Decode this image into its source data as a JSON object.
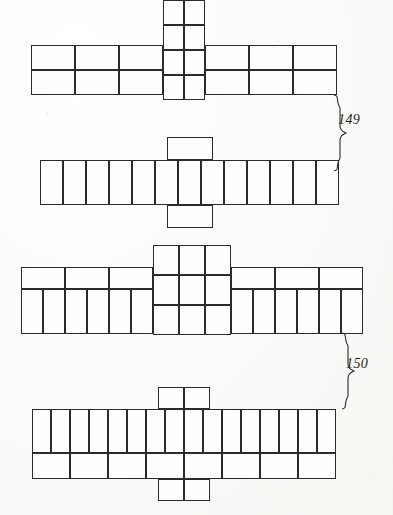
{
  "document": {
    "kind": "printed-plate",
    "background_color": "#fdfdfb",
    "ink_color": "#2b2b2b",
    "page_width": 393,
    "page_height": 515
  },
  "labels": [
    {
      "id": "label-149",
      "text": "149",
      "x": 340,
      "y": 119
    },
    {
      "id": "label-150",
      "text": "150",
      "x": 348,
      "y": 362
    }
  ],
  "braces": [
    {
      "id": "brace-149",
      "spans": "figure-1 and figure-2",
      "x": 336,
      "y": 96,
      "height": 72
    },
    {
      "id": "brace-150",
      "spans": "figure-3 and figure-4",
      "x": 344,
      "y": 334,
      "height": 72
    }
  ],
  "figures": [
    {
      "id": "figure-1",
      "name": "cross-net-top",
      "description": "Horizontal band of 3+3 wide cells in 2 rows with a central 2-wide x 4-tall column",
      "left_wing": {
        "cols": 3,
        "rows": 2
      },
      "right_wing": {
        "cols": 3,
        "rows": 2
      },
      "center": {
        "cols": 2,
        "rows": 4
      }
    },
    {
      "id": "figure-2",
      "name": "strip-net-second",
      "description": "Single row of 13 tall narrow cells with one wide tab above and one below at the centre",
      "strip_cells": 13,
      "tab_above": 1,
      "tab_below": 1
    },
    {
      "id": "figure-3",
      "name": "cross-net-third",
      "description": "Wings of 3 wide cells over 6 narrow cells, with a central 3x3 block",
      "left_wing": {
        "top_cols": 3,
        "bottom_cols": 6
      },
      "right_wing": {
        "top_cols": 3,
        "bottom_cols": 6
      },
      "center": {
        "cols": 3,
        "rows": 3
      }
    },
    {
      "id": "figure-4",
      "name": "strip-net-bottom",
      "description": "Top row of 16 narrow cells over bottom row of 8 wide cells, with a 2-cell tab above and below",
      "top_cells": 16,
      "bottom_cells": 8,
      "tab_above": 2,
      "tab_below": 2
    }
  ]
}
